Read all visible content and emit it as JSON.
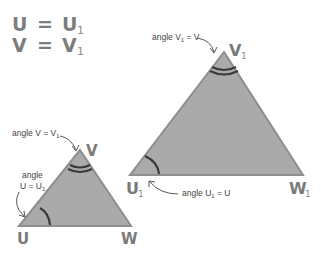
{
  "equations": [
    {
      "left": "U",
      "op": "=",
      "right": "U",
      "right_sub": "1"
    },
    {
      "left": "V",
      "op": "=",
      "right": "V",
      "right_sub": "1"
    }
  ],
  "small_triangle": {
    "vertices": {
      "U": {
        "label": "U",
        "sub": ""
      },
      "V": {
        "label": "V",
        "sub": ""
      },
      "W": {
        "label": "W",
        "sub": ""
      }
    },
    "annotations": {
      "angle_v": {
        "prefix": "angle V = V",
        "sub": "1",
        "suffix": ""
      },
      "angle_u_line1": "angle",
      "angle_u_line2": {
        "prefix": "U = U",
        "sub": "1"
      }
    }
  },
  "large_triangle": {
    "vertices": {
      "U": {
        "label": "U",
        "sub": "1"
      },
      "V": {
        "label": "V",
        "sub": "1"
      },
      "W": {
        "label": "W",
        "sub": "1"
      }
    },
    "annotations": {
      "angle_v": {
        "prefix": "angle V",
        "sub": "1",
        "suffix": " = V"
      },
      "angle_u": {
        "prefix": "angle U",
        "sub": "1",
        "suffix": " = U"
      }
    }
  },
  "colors": {
    "triangle_fill": "#aaaaaa",
    "triangle_stroke": "#8e8e8e",
    "arc": "#3a3a3a",
    "label": "#7a7a7a",
    "annotation_text": "#444444"
  }
}
